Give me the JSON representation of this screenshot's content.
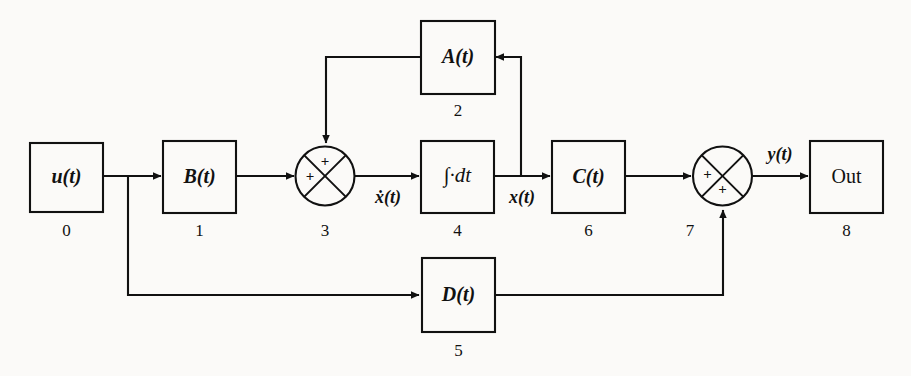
{
  "diagram": {
    "background_color": "#fbfaf8",
    "stroke_color": "#111111",
    "blocks": [
      {
        "id": "0",
        "label": "u(t)",
        "index": "0",
        "type": "rect",
        "name": "input-block"
      },
      {
        "id": "1",
        "label": "B(t)",
        "index": "1",
        "type": "rect",
        "name": "b-gain-block"
      },
      {
        "id": "2",
        "label": "A(t)",
        "index": "2",
        "type": "rect",
        "name": "a-gain-block"
      },
      {
        "id": "3",
        "label": "",
        "index": "3",
        "type": "sum",
        "name": "state-summing-junction"
      },
      {
        "id": "4",
        "label": "∫·dt",
        "index": "4",
        "type": "rect",
        "name": "integrator-block"
      },
      {
        "id": "5",
        "label": "D(t)",
        "index": "5",
        "type": "rect",
        "name": "d-feedthrough-block"
      },
      {
        "id": "6",
        "label": "C(t)",
        "index": "6",
        "type": "rect",
        "name": "c-gain-block"
      },
      {
        "id": "7",
        "label": "",
        "index": "7",
        "type": "sum",
        "name": "output-summing-junction"
      },
      {
        "id": "8",
        "label": "Out",
        "index": "8",
        "type": "rect",
        "name": "output-block"
      }
    ],
    "signals": [
      {
        "id": "xdot",
        "label": "ẋ(t)",
        "name": "state-derivative-signal-label"
      },
      {
        "id": "x",
        "label": "x(t)",
        "name": "state-signal-label"
      },
      {
        "id": "y",
        "label": "y(t)",
        "name": "output-signal-label"
      }
    ],
    "signs": {
      "sum3_top": "+",
      "sum3_left": "+",
      "sum7_left": "+",
      "sum7_bottom": "+"
    }
  }
}
